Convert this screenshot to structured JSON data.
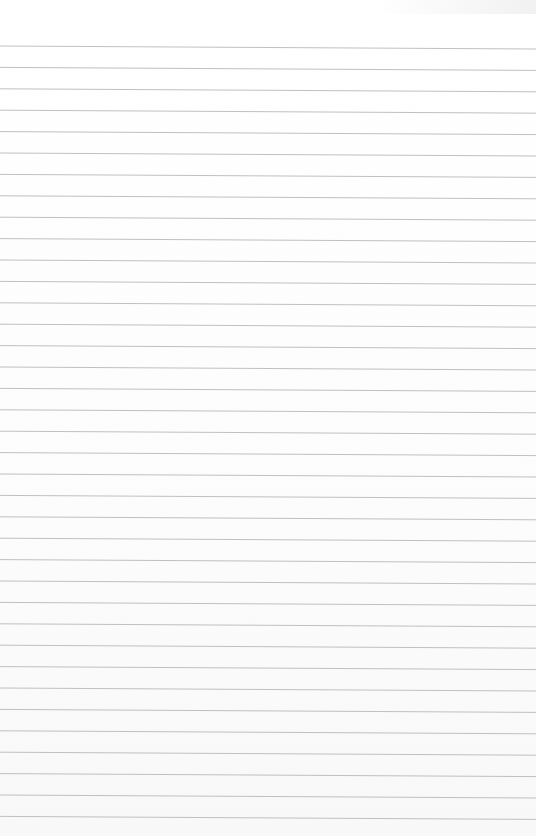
{
  "page": {
    "type": "lined-paper",
    "background_color": "#fdfdfd",
    "line_color": "#b9b9b9",
    "line_count": 37,
    "first_line_y": 46,
    "line_spacing": 21.4,
    "tilt_px": 3,
    "text": ""
  }
}
